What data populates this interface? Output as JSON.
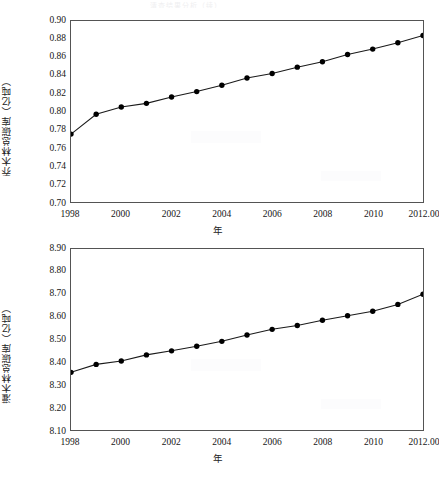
{
  "page": {
    "faint_header_text": "清查结果分析（续）"
  },
  "figures": [
    {
      "id": "figure-1",
      "name": "tree-forest-carbon-stock-chart",
      "y_axis_label": "乔木林总碳库（亿吨）",
      "x_axis_label": "年",
      "y_ticks": [
        "0.90",
        "0.88",
        "0.86",
        "0.84",
        "0.82",
        "0.80",
        "0.78",
        "0.76",
        "0.74",
        "0.72",
        "0.70"
      ],
      "x_ticks": [
        "1998",
        "2000",
        "2002",
        "2004",
        "2006",
        "2008",
        "2010",
        "2012.00"
      ]
    },
    {
      "id": "figure-2",
      "name": "shrub-forest-carbon-stock-chart",
      "y_axis_label": "灌木林总碳库（亿吨）",
      "x_axis_label": "年",
      "y_ticks": [
        "8.90",
        "8.80",
        "8.70",
        "8.60",
        "8.50",
        "8.40",
        "8.30",
        "8.20",
        "8.10"
      ],
      "x_ticks": [
        "1998",
        "2000",
        "2002",
        "2004",
        "2006",
        "2008",
        "2010",
        "2012.00"
      ]
    }
  ],
  "chart_data": [
    {
      "type": "line",
      "title": "",
      "subtitle": "",
      "xlabel": "年",
      "ylabel": "乔木林总碳库（亿吨）",
      "x": [
        1998,
        1999,
        2000,
        2001,
        2002,
        2003,
        2004,
        2005,
        2006,
        2007,
        2008,
        2009,
        2010,
        2011,
        2012
      ],
      "values": [
        0.775,
        0.797,
        0.805,
        0.809,
        0.816,
        0.822,
        0.829,
        0.837,
        0.842,
        0.849,
        0.855,
        0.863,
        0.869,
        0.876,
        0.884
      ],
      "xlim": [
        1998,
        2012
      ],
      "ylim": [
        0.7,
        0.9
      ],
      "ytick_step": 0.02,
      "xtick_values": [
        1998,
        2000,
        2002,
        2004,
        2006,
        2008,
        2010,
        2012
      ],
      "xtick_labels": [
        "1998",
        "2000",
        "2002",
        "2004",
        "2006",
        "2008",
        "2010",
        "2012.00"
      ],
      "ytick_labels": [
        "0.70",
        "0.72",
        "0.74",
        "0.76",
        "0.78",
        "0.80",
        "0.82",
        "0.84",
        "0.86",
        "0.88",
        "0.90"
      ],
      "grid": false,
      "legend": null,
      "marker": "filled-circle",
      "marker_color": "#000000",
      "line_color": "#1a1a1a",
      "annotations": []
    },
    {
      "type": "line",
      "title": "",
      "subtitle": "",
      "xlabel": "年",
      "ylabel": "灌木林总碳库（亿吨）",
      "x": [
        1998,
        1999,
        2000,
        2001,
        2002,
        2003,
        2004,
        2005,
        2006,
        2007,
        2008,
        2009,
        2010,
        2011,
        2012
      ],
      "values": [
        8.355,
        8.39,
        8.405,
        8.432,
        8.45,
        8.47,
        8.492,
        8.52,
        8.545,
        8.562,
        8.585,
        8.605,
        8.625,
        8.655,
        8.7
      ],
      "xlim": [
        1998,
        2012
      ],
      "ylim": [
        8.1,
        8.9
      ],
      "ytick_step": 0.1,
      "xtick_values": [
        1998,
        2000,
        2002,
        2004,
        2006,
        2008,
        2010,
        2012
      ],
      "xtick_labels": [
        "1998",
        "2000",
        "2002",
        "2004",
        "2006",
        "2008",
        "2010",
        "2012.00"
      ],
      "ytick_labels": [
        "8.10",
        "8.20",
        "8.30",
        "8.40",
        "8.50",
        "8.60",
        "8.70",
        "8.80",
        "8.90"
      ],
      "grid": false,
      "legend": null,
      "marker": "filled-circle",
      "marker_color": "#000000",
      "line_color": "#1a1a1a",
      "annotations": []
    }
  ]
}
